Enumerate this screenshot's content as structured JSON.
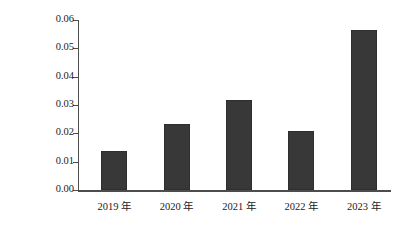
{
  "chart_data": {
    "type": "bar",
    "title": "",
    "xlabel": "",
    "ylabel": "总磷含量（mg/L）",
    "categories": [
      "2019 年",
      "2020 年",
      "2021 年",
      "2022 年",
      "2023 年"
    ],
    "values": [
      0.0137,
      0.0232,
      0.0319,
      0.0207,
      0.0565
    ],
    "ylim": [
      0.0,
      0.06
    ],
    "yticks": [
      0.0,
      0.01,
      0.02,
      0.03,
      0.04,
      0.05,
      0.06
    ],
    "ytick_labels": [
      "0.00",
      "0.01",
      "0.02",
      "0.03",
      "0.04",
      "0.05",
      "0.06"
    ],
    "grid": false,
    "legend": false,
    "bar_color": "#383838",
    "axis_color": "#4d4d4d",
    "background": "#ffffff"
  }
}
